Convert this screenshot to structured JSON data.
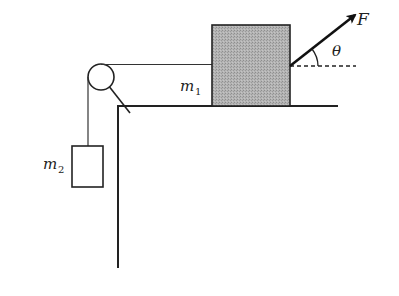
{
  "diagram": {
    "type": "physics-free-body",
    "labels": {
      "m1": "m",
      "m1_sub": "1",
      "m2": "m",
      "m2_sub": "2",
      "force": "F",
      "angle": "θ"
    },
    "colors": {
      "line": "#222222",
      "block_fill": "#a9a9a9",
      "background": "#ffffff"
    },
    "elements": [
      {
        "name": "table-surface",
        "kind": "line"
      },
      {
        "name": "table-wall",
        "kind": "line"
      },
      {
        "name": "pulley",
        "kind": "circle"
      },
      {
        "name": "pulley-support",
        "kind": "line"
      },
      {
        "name": "rope-horizontal",
        "kind": "line"
      },
      {
        "name": "rope-vertical",
        "kind": "line"
      },
      {
        "name": "block-m1",
        "kind": "rect",
        "filled": true
      },
      {
        "name": "block-m2",
        "kind": "rect",
        "filled": false
      },
      {
        "name": "force-arrow-F",
        "kind": "arrow"
      },
      {
        "name": "reference-dashed-line",
        "kind": "dashed-line"
      },
      {
        "name": "angle-arc-theta",
        "kind": "arc"
      }
    ]
  }
}
